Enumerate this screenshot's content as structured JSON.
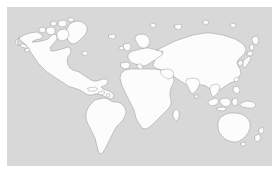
{
  "figure": {
    "kind": "world-map",
    "projection_hint": "equirectangular",
    "width_px": 279,
    "height_px": 171,
    "outer_background_color": "#ffffff",
    "ocean_color": "#d8d8d8",
    "land_fill_color": "#fcfcfc",
    "coastline_color": "#8e8e8e",
    "panel": {
      "left_px": 7,
      "top_px": 7,
      "width_px": 265,
      "height_px": 159
    },
    "has_title": false,
    "has_legend": false,
    "has_graticule": false,
    "has_labels": false,
    "title": "",
    "subtitle": "",
    "caption": ""
  },
  "chart_data": {
    "type": "map",
    "title": "",
    "xlabel": "",
    "ylabel": "",
    "grid": false,
    "legend": null,
    "regions": [
      {
        "name": "North America",
        "visible": true
      },
      {
        "name": "Greenland",
        "visible": true
      },
      {
        "name": "Canadian Arctic Archipelago",
        "visible": true
      },
      {
        "name": "Central America",
        "visible": true
      },
      {
        "name": "Caribbean Islands",
        "visible": true
      },
      {
        "name": "South America",
        "visible": true
      },
      {
        "name": "Europe",
        "visible": true
      },
      {
        "name": "British Isles",
        "visible": true
      },
      {
        "name": "Iceland",
        "visible": true
      },
      {
        "name": "Scandinavia",
        "visible": true
      },
      {
        "name": "Africa",
        "visible": true
      },
      {
        "name": "Madagascar",
        "visible": true
      },
      {
        "name": "Asia",
        "visible": true
      },
      {
        "name": "Arabian Peninsula",
        "visible": true
      },
      {
        "name": "Indian Subcontinent",
        "visible": true
      },
      {
        "name": "Japan",
        "visible": true
      },
      {
        "name": "Korea",
        "visible": true
      },
      {
        "name": "Southeast Asia",
        "visible": true
      },
      {
        "name": "Indonesia",
        "visible": true
      },
      {
        "name": "Philippines",
        "visible": true
      },
      {
        "name": "New Guinea",
        "visible": true
      },
      {
        "name": "Australia",
        "visible": true
      },
      {
        "name": "New Zealand",
        "visible": true
      },
      {
        "name": "Sri Lanka",
        "visible": true
      },
      {
        "name": "Antarctica",
        "visible": false
      }
    ]
  },
  "accessibility": {
    "map_description": "Outline world map with white landmasses and gray ocean background"
  }
}
